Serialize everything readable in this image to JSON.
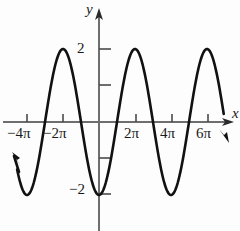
{
  "chart_data": {
    "type": "line",
    "title": "",
    "xlabel": "x",
    "ylabel": "y",
    "function": "y = -2cos(x/2)",
    "amplitude": 2,
    "period": "4π",
    "xlim": [
      "-5π",
      "7π"
    ],
    "ylim": [
      -2.6,
      2.6
    ],
    "grid": false,
    "legend": null,
    "x_tick_labels": [
      "−4π",
      "−2π",
      "2π",
      "4π",
      "6π"
    ],
    "x_tick_values": [
      -4,
      -2,
      2,
      4,
      6
    ],
    "x_tick_unit": "π",
    "y_tick_labels": [
      "2",
      "−2"
    ],
    "y_tick_values": [
      2,
      -2
    ],
    "y_unlabeled_ticks": [
      1,
      -1
    ],
    "maxima": [
      {
        "x": "-2π",
        "y": 2
      },
      {
        "x": "2π",
        "y": 2
      },
      {
        "x": "6π",
        "y": 2
      }
    ],
    "minima": [
      {
        "x": "-4π",
        "y": -2
      },
      {
        "x": "0",
        "y": -2
      },
      {
        "x": "4π",
        "y": -2
      }
    ],
    "zero_crossings": [
      "-3π",
      "-1π",
      "1π",
      "3π",
      "5π"
    ],
    "curve_end_arrows": [
      "left-up",
      "right-down"
    ],
    "axis_arrows": [
      "y-up",
      "x-right"
    ],
    "colors": {
      "curve": "#111111",
      "axis": "#555555",
      "background": "#fdfdfd",
      "text": "#1a1a1a"
    }
  },
  "labels": {
    "x_neg_four_pi": "−4π",
    "x_neg_two_pi": "−2π",
    "x_two_pi": "2π",
    "x_four_pi": "4π",
    "x_six_pi": "6π",
    "y_two": "2",
    "y_neg_two": "−2",
    "y_axis_name": "y",
    "x_axis_name": "x"
  }
}
